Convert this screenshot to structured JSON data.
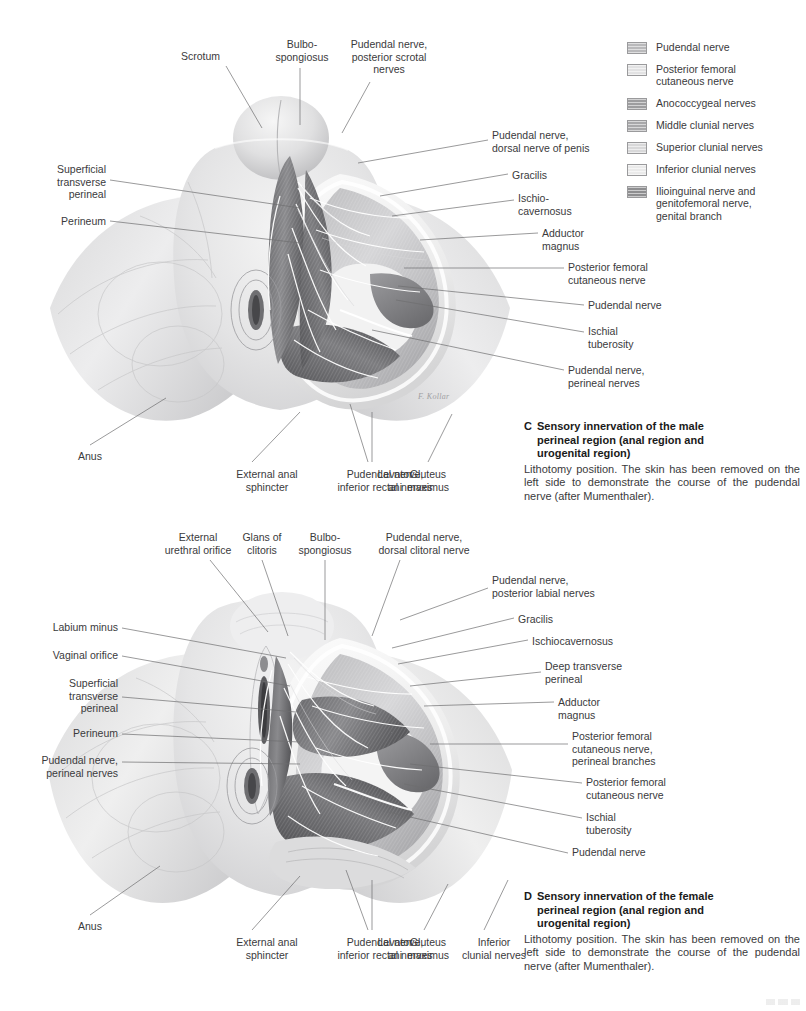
{
  "page": {
    "background": "#ffffff",
    "text_color": "#3a3a3c",
    "width": 806,
    "height": 1011
  },
  "legend": {
    "items": [
      {
        "label": "Pudendal nerve",
        "color": "#b9b9bb"
      },
      {
        "label": "Posterior femoral\ncutaneous nerve",
        "color": "#e2e2e3"
      },
      {
        "label": "Anococcygeal nerves",
        "color": "#9d9d9f"
      },
      {
        "label": "Middle clunial nerves",
        "color": "#a8a8aa"
      },
      {
        "label": "Superior clunial nerves",
        "color": "#d8d8d9"
      },
      {
        "label": "Inferior clunial nerves",
        "color": "#eaeaea"
      },
      {
        "label": "Ilioinguinal nerve and\ngenitofemoral nerve,\ngenital branch",
        "color": "#8e8e90"
      }
    ]
  },
  "panel_c": {
    "letter": "C",
    "title": "Sensory innervation of the male\nperineal region (anal region and\nurogenital region)",
    "body": "Lithotomy position. The skin has been removed on the left side to demonstrate the course of the pudendal nerve (after Mumenthaler).",
    "signature": "F. Kollar",
    "labels": [
      {
        "name": "scrotum",
        "text": "Scrotum",
        "align": "r",
        "x": 140,
        "y": 50,
        "w": 80
      },
      {
        "name": "bulbospongiosus",
        "text": "Bulbo-\nspongiosus",
        "align": "c",
        "x": 265,
        "y": 38,
        "w": 74
      },
      {
        "name": "pudendal-nerve-posterior-scrotal-nerves",
        "text": "Pudendal nerve,\nposterior scrotal\nnerves",
        "align": "c",
        "x": 338,
        "y": 38,
        "w": 102
      },
      {
        "name": "superficial-transverse-perineal",
        "text": "Superficial\ntransverse\nperineal",
        "align": "r",
        "x": 22,
        "y": 163,
        "w": 84
      },
      {
        "name": "perineum",
        "text": "Perineum",
        "align": "r",
        "x": 22,
        "y": 215,
        "w": 84
      },
      {
        "name": "pudendal-nerve-dorsal-nerve-of-penis",
        "text": "Pudendal nerve,\ndorsal nerve of penis",
        "align": "l",
        "x": 492,
        "y": 129,
        "w": 130
      },
      {
        "name": "gracilis",
        "text": "Gracilis",
        "align": "l",
        "x": 512,
        "y": 169,
        "w": 80
      },
      {
        "name": "ischiocavernosus",
        "text": "Ischio-\ncavernosus",
        "align": "l",
        "x": 518,
        "y": 192,
        "w": 82
      },
      {
        "name": "adductor-magnus",
        "text": "Adductor\nmagnus",
        "align": "l",
        "x": 542,
        "y": 227,
        "w": 80
      },
      {
        "name": "posterior-femoral-cutaneous-nerve",
        "text": "Posterior femoral\ncutaneous nerve",
        "align": "l",
        "x": 568,
        "y": 261,
        "w": 120
      },
      {
        "name": "pudendal-nerve",
        "text": "Pudendal nerve",
        "align": "l",
        "x": 588,
        "y": 299,
        "w": 110
      },
      {
        "name": "ischial-tuberosity",
        "text": "Ischial\ntuberosity",
        "align": "l",
        "x": 588,
        "y": 325,
        "w": 90
      },
      {
        "name": "pudendal-nerve-perineal-nerves",
        "text": "Pudendal nerve,\nperineal nerves",
        "align": "l",
        "x": 568,
        "y": 364,
        "w": 120
      },
      {
        "name": "anus",
        "text": "Anus",
        "align": "c",
        "x": 67,
        "y": 450,
        "w": 46
      },
      {
        "name": "external-anal-sphincter",
        "text": "External anal\nsphincter",
        "align": "c",
        "x": 222,
        "y": 468,
        "w": 90
      },
      {
        "name": "pudendal-nerve-inferior-rectal-nerves",
        "text": "Pudendal nerve,\ninferior rectal nerves",
        "align": "c",
        "x": 322,
        "y": 468,
        "w": 126
      },
      {
        "name": "levator-ani",
        "text": "Levator\nani",
        "align": "c",
        "x": 358,
        "y": 468,
        "w": 74
      },
      {
        "name": "gluteus-maximus",
        "text": "Gluteus\nmaximus",
        "align": "c",
        "x": 388,
        "y": 468,
        "w": 80
      }
    ]
  },
  "panel_d": {
    "letter": "D",
    "title": "Sensory innervation of the female\nperineal region (anal region and\nurogenital region)",
    "body": "Lithotomy position. The skin has been removed on the left side to demonstrate the course of the pudendal nerve (after Mumenthaler).",
    "labels": [
      {
        "name": "external-urethral-orifice",
        "text": "External\nurethral orifice",
        "align": "c",
        "x": 152,
        "y": 531,
        "w": 92
      },
      {
        "name": "glans-of-clitoris",
        "text": "Glans of\nclitoris",
        "align": "c",
        "x": 228,
        "y": 531,
        "w": 68
      },
      {
        "name": "bulbospongiosus",
        "text": "Bulbo-\nspongiosus",
        "align": "c",
        "x": 288,
        "y": 531,
        "w": 74
      },
      {
        "name": "pudendal-nerve-dorsal-clitoral-nerve",
        "text": "Pudendal nerve,\ndorsal clitoral nerve",
        "align": "c",
        "x": 360,
        "y": 531,
        "w": 128
      },
      {
        "name": "pudendal-nerve-posterior-labial-nerves",
        "text": "Pudendal nerve,\nposterior labial nerves",
        "align": "l",
        "x": 492,
        "y": 574,
        "w": 136
      },
      {
        "name": "gracilis",
        "text": "Gracilis",
        "align": "l",
        "x": 518,
        "y": 613,
        "w": 80
      },
      {
        "name": "ischiocavernosus",
        "text": "Ischiocavernosus",
        "align": "l",
        "x": 532,
        "y": 635,
        "w": 116
      },
      {
        "name": "deep-transverse-perineal",
        "text": "Deep transverse\nperineal",
        "align": "l",
        "x": 545,
        "y": 660,
        "w": 112
      },
      {
        "name": "adductor-magnus",
        "text": "Adductor\nmagnus",
        "align": "l",
        "x": 558,
        "y": 696,
        "w": 80
      },
      {
        "name": "posterior-femoral-cutaneous-nerve-perineal-branches",
        "text": "Posterior femoral\ncutaneous nerve,\nperineal branches",
        "align": "l",
        "x": 572,
        "y": 730,
        "w": 122
      },
      {
        "name": "posterior-femoral-cutaneous-nerve",
        "text": "Posterior femoral\ncutaneous nerve",
        "align": "l",
        "x": 586,
        "y": 776,
        "w": 122
      },
      {
        "name": "ischial-tuberosity",
        "text": "Ischial\ntuberosity",
        "align": "l",
        "x": 586,
        "y": 811,
        "w": 90
      },
      {
        "name": "pudendal-nerve",
        "text": "Pudendal nerve",
        "align": "l",
        "x": 572,
        "y": 846,
        "w": 110
      },
      {
        "name": "labium-minus",
        "text": "Labium minus",
        "align": "r",
        "x": 22,
        "y": 621,
        "w": 96
      },
      {
        "name": "vaginal-orifice",
        "text": "Vaginal orifice",
        "align": "r",
        "x": 22,
        "y": 649,
        "w": 96
      },
      {
        "name": "superficial-transverse-perineal",
        "text": "Superficial\ntransverse\nperineal",
        "align": "r",
        "x": 22,
        "y": 677,
        "w": 96
      },
      {
        "name": "perineum",
        "text": "Perineum",
        "align": "r",
        "x": 22,
        "y": 727,
        "w": 96
      },
      {
        "name": "pudendal-nerve-perineal-nerves",
        "text": "Pudendal nerve,\nperineal nerves",
        "align": "r",
        "x": 6,
        "y": 754,
        "w": 112
      },
      {
        "name": "anus",
        "text": "Anus",
        "align": "c",
        "x": 67,
        "y": 920,
        "w": 46
      },
      {
        "name": "external-anal-sphincter",
        "text": "External anal\nsphincter",
        "align": "c",
        "x": 222,
        "y": 936,
        "w": 90
      },
      {
        "name": "pudendal-nerve-inferior-rectal-nerves",
        "text": "Pudendal nerve,\ninferior rectal nerves",
        "align": "c",
        "x": 322,
        "y": 936,
        "w": 126
      },
      {
        "name": "levator-ani",
        "text": "Levator\nani",
        "align": "c",
        "x": 358,
        "y": 936,
        "w": 74
      },
      {
        "name": "gluteus-maximus",
        "text": "Gluteus\nmaximus",
        "align": "c",
        "x": 388,
        "y": 936,
        "w": 80
      },
      {
        "name": "inferior-clunial-nerves",
        "text": "Inferior\nclunial nerves",
        "align": "c",
        "x": 448,
        "y": 936,
        "w": 92
      }
    ]
  }
}
